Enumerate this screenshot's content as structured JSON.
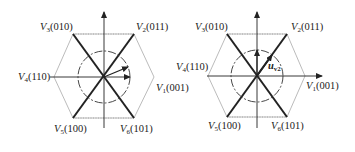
{
  "diagrams": [
    {
      "name": "left-hexagon",
      "center": [
        104,
        77
      ],
      "vertices": {
        "V1": {
          "letter": "V",
          "sub": "1",
          "code": "(001)"
        },
        "V2": {
          "letter": "V",
          "sub": "2",
          "code": "(011)"
        },
        "V3": {
          "letter": "V",
          "sub": "3",
          "code": "(010)"
        },
        "V4": {
          "letter": "V",
          "sub": "4",
          "code": "(110)"
        },
        "V5": {
          "letter": "V",
          "sub": "5",
          "code": "(100)"
        },
        "V6": {
          "letter": "V",
          "sub": "6",
          "code": "(101)"
        }
      }
    },
    {
      "name": "right-hexagon",
      "center": [
        257,
        76
      ],
      "vector_label": {
        "letter": "u",
        "sub": "v2"
      },
      "vertices": {
        "V1": {
          "letter": "V",
          "sub": "1",
          "code": "(001)"
        },
        "V2": {
          "letter": "V",
          "sub": "2",
          "code": "(011)"
        },
        "V3": {
          "letter": "V",
          "sub": "3",
          "code": "(010)"
        },
        "V4": {
          "letter": "V",
          "sub": "4",
          "code": "(110)"
        },
        "V5": {
          "letter": "V",
          "sub": "5",
          "code": "(100)"
        },
        "V6": {
          "letter": "V",
          "sub": "6",
          "code": "(101)"
        }
      }
    }
  ],
  "colors": {
    "line": "#222222",
    "hex": "#9a9a9a"
  }
}
